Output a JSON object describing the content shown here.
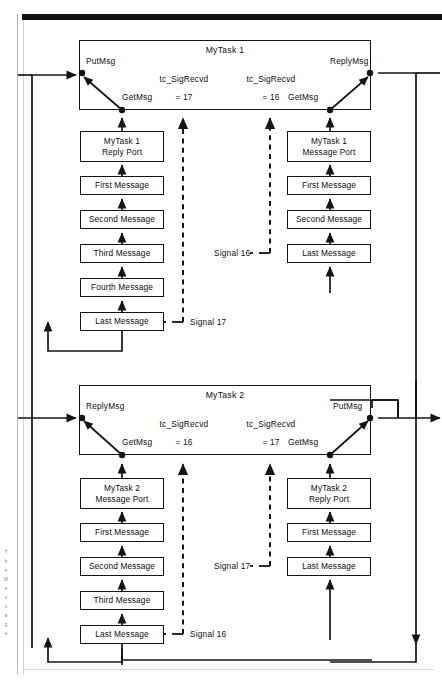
{
  "figure": {
    "type": "block-flow-diagram"
  },
  "tasks": [
    {
      "id": "task1",
      "title": "MyTask 1",
      "ports": {
        "left_top": "PutMsg",
        "left_bottom": "GetMsg",
        "right_top": "ReplyMsg",
        "right_bottom": "GetMsg"
      },
      "signals": [
        {
          "name": "tc_SigRecvd",
          "value": "= 17"
        },
        {
          "name": "tc_SigRecvd",
          "value": "= 16"
        }
      ]
    },
    {
      "id": "task2",
      "title": "MyTask 2",
      "ports": {
        "left_top": "ReplyMsg",
        "left_bottom": "GetMsg",
        "right_top": "PutMsg",
        "right_bottom": "GetMsg"
      },
      "signals": [
        {
          "name": "tc_SigRecvd",
          "value": "= 16"
        },
        {
          "name": "tc_SigRecvd",
          "value": "= 17"
        }
      ]
    }
  ],
  "queues": {
    "task1_reply": {
      "head_line1": "MyTask 1",
      "head_line2": "Reply Port",
      "messages": [
        "First Message",
        "Second Message",
        "Third Message",
        "Fourth Message",
        "Last Message"
      ]
    },
    "task1_message": {
      "head_line1": "MyTask 1",
      "head_line2": "Message Port",
      "messages": [
        "First Message",
        "Second Message",
        "Last Message"
      ]
    },
    "task2_message": {
      "head_line1": "MyTask 2",
      "head_line2": "Message Port",
      "messages": [
        "First Message",
        "Second Message",
        "Third Message",
        "Last Message"
      ]
    },
    "task2_reply": {
      "head_line1": "MyTask 2",
      "head_line2": "Reply Port",
      "messages": [
        "First Message",
        "Last Message"
      ]
    }
  },
  "signal_labels": {
    "t1_signal17": "Signal 17",
    "t1_signal16": "Signal 16",
    "t2_signal16": "Signal 16",
    "t2_signal17": "Signal 17"
  },
  "margin_notes": [
    "T",
    "h",
    "e",
    "",
    "M",
    "e",
    "s",
    "s",
    "a",
    "g",
    "e"
  ],
  "colors": {
    "ink": "#141414",
    "paper": "#ffffff",
    "rule": "#d2d2d2",
    "topbar": "#111111"
  }
}
